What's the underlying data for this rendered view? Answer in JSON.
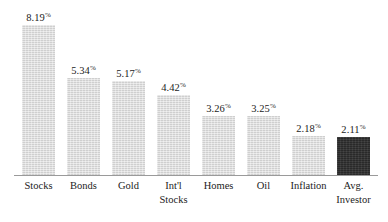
{
  "chart_data": {
    "type": "bar",
    "title": "",
    "subtitle": "",
    "xlabel": "",
    "ylabel": "",
    "grid": false,
    "legend": "none",
    "axis": {
      "y_visible": false,
      "y_ticks": [],
      "ylim": [
        0,
        9.0
      ],
      "x_baseline_visible": true
    },
    "value_suffix": "%",
    "categories": [
      "Stocks",
      "Bonds",
      "Gold",
      "Int'l Stocks",
      "Homes",
      "Oil",
      "Inflation",
      "Avg. Investor"
    ],
    "values": [
      8.19,
      5.34,
      5.17,
      4.42,
      3.26,
      3.25,
      2.18,
      2.11
    ],
    "value_labels": [
      "8.19",
      "5.34",
      "5.17",
      "4.42",
      "3.26",
      "3.25",
      "2.18",
      "2.11"
    ],
    "colors": {
      "bar_default": "#d8d8d8",
      "bar_highlight": "#333333",
      "axis_line": "#9a9a9a",
      "text": "#1c1c1c"
    },
    "highlight_index": 7,
    "bars": [
      {
        "category": "Stocks",
        "label_line1": "Stocks",
        "label_line2": "",
        "value": 8.19,
        "value_label": "8.19",
        "percent_symbol": "%",
        "color": "#d8d8d8",
        "highlighted": false
      },
      {
        "category": "Bonds",
        "label_line1": "Bonds",
        "label_line2": "",
        "value": 5.34,
        "value_label": "5.34",
        "percent_symbol": "%",
        "color": "#d8d8d8",
        "highlighted": false
      },
      {
        "category": "Gold",
        "label_line1": "Gold",
        "label_line2": "",
        "value": 5.17,
        "value_label": "5.17",
        "percent_symbol": "%",
        "color": "#d8d8d8",
        "highlighted": false
      },
      {
        "category": "Int'l Stocks",
        "label_line1": "Int'l",
        "label_line2": "Stocks",
        "value": 4.42,
        "value_label": "4.42",
        "percent_symbol": "%",
        "color": "#d8d8d8",
        "highlighted": false
      },
      {
        "category": "Homes",
        "label_line1": "Homes",
        "label_line2": "",
        "value": 3.26,
        "value_label": "3.26",
        "percent_symbol": "%",
        "color": "#d8d8d8",
        "highlighted": false
      },
      {
        "category": "Oil",
        "label_line1": "Oil",
        "label_line2": "",
        "value": 3.25,
        "value_label": "3.25",
        "percent_symbol": "%",
        "color": "#d8d8d8",
        "highlighted": false
      },
      {
        "category": "Inflation",
        "label_line1": "Inflation",
        "label_line2": "",
        "value": 2.18,
        "value_label": "2.18",
        "percent_symbol": "%",
        "color": "#d8d8d8",
        "highlighted": false
      },
      {
        "category": "Avg. Investor",
        "label_line1": "Avg.",
        "label_line2": "Investor",
        "value": 2.11,
        "value_label": "2.11",
        "percent_symbol": "%",
        "color": "#333333",
        "highlighted": true
      }
    ]
  }
}
